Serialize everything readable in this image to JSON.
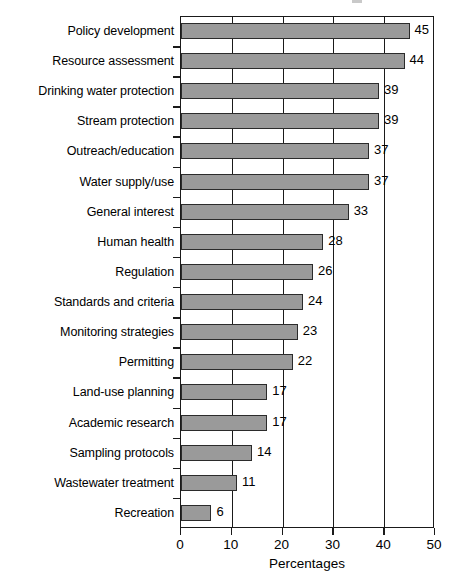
{
  "chart_data": {
    "type": "bar",
    "orientation": "horizontal",
    "title": "",
    "xlabel": "Percentages",
    "ylabel": "",
    "xlim": [
      0,
      50
    ],
    "xticks": [
      0,
      10,
      20,
      30,
      40,
      50
    ],
    "grid": "vertical",
    "legend": "none",
    "show_value_labels": true,
    "categories": [
      "Policy development",
      "Resource assessment",
      "Drinking water protection",
      "Stream protection",
      "Outreach/education",
      "Water supply/use",
      "General interest",
      "Human health",
      "Regulation",
      "Standards and criteria",
      "Monitoring strategies",
      "Permitting",
      "Land-use planning",
      "Academic research",
      "Sampling protocols",
      "Wastewater treatment",
      "Recreation"
    ],
    "values": [
      45,
      44,
      39,
      39,
      37,
      37,
      33,
      28,
      26,
      24,
      23,
      22,
      17,
      17,
      14,
      11,
      6
    ],
    "value_labels": [
      "45",
      "44",
      "39",
      "39",
      "37",
      "37",
      "33",
      "28",
      "26",
      "24",
      "23",
      "22",
      "17",
      "17",
      "14",
      "11",
      "6"
    ],
    "xtick_labels": [
      "0",
      "10",
      "20",
      "30",
      "40",
      "50"
    ],
    "colors": {
      "bar_fill": "#9a9a9a",
      "bar_border": "#2b2b2b",
      "axis": "#1a1a1a",
      "grid": "#1a1a1a",
      "text": "#000000",
      "background": "#ffffff"
    }
  }
}
